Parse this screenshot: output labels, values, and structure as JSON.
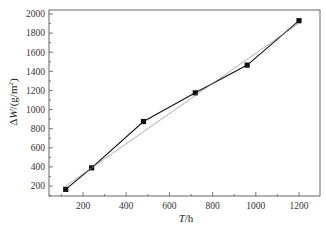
{
  "chart_data": {
    "type": "line",
    "title": "",
    "xlabel": "T/h",
    "ylabel": "ΔW/(g/m²)",
    "xlim": [
      40,
      1290
    ],
    "ylim": [
      50,
      2030
    ],
    "xticks": [
      200,
      400,
      600,
      800,
      1000,
      1200
    ],
    "yticks": [
      200,
      400,
      600,
      800,
      1000,
      1200,
      1400,
      1600,
      1800,
      2000
    ],
    "grid": false,
    "legend": null,
    "series": [
      {
        "name": "measured",
        "style": "line-with-square-markers",
        "color": "#111111",
        "x": [
          120,
          240,
          480,
          720,
          960,
          1200
        ],
        "y": [
          165,
          390,
          875,
          1175,
          1465,
          1930
        ]
      },
      {
        "name": "linear fit",
        "style": "thin-line",
        "color": "#888888",
        "x": [
          120,
          1200
        ],
        "y": [
          200,
          1905
        ]
      }
    ]
  }
}
